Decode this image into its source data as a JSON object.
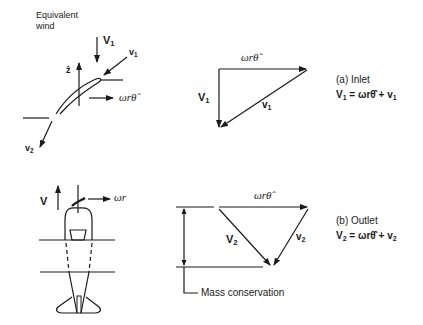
{
  "figure": {
    "top_left": {
      "title_line1": "Equivalent",
      "title_line2": "wind",
      "labels": {
        "V1_main": "V",
        "V1_sub": "1",
        "v1_main": "v",
        "v1_sub": "1",
        "z_hat": "ẑ",
        "omega_r_theta": "ωrθ̂",
        "v2_main": "v",
        "v2_sub": "2"
      }
    },
    "inlet_triangle": {
      "top_label": "ωrθ̂",
      "left_label_main": "V",
      "left_label_sub": "1",
      "hyp_label_main": "v",
      "hyp_label_sub": "1"
    },
    "inlet_caption": {
      "title": "(a) Inlet",
      "eq_lhs_main": "V",
      "eq_lhs_sub": "1",
      "eq_mid": " = ωrθ̂ + ",
      "eq_rhs_main": "v",
      "eq_rhs_sub": "1"
    },
    "bottom_left": {
      "V_label": "V",
      "omega_r": "ωr"
    },
    "outlet_triangle": {
      "top_label": "ωrθ̂",
      "left_label_main": "V",
      "left_label_sub": "2",
      "right_label_main": "v",
      "right_label_sub": "2",
      "mass_label": "Mass conservation"
    },
    "outlet_caption": {
      "title": "(b) Outlet",
      "eq_lhs_main": "V",
      "eq_lhs_sub": "2",
      "eq_mid": " = ωrθ̂ + ",
      "eq_rhs_main": "v",
      "eq_rhs_sub": "2"
    }
  }
}
